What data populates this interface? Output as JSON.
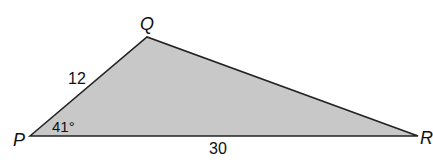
{
  "diagram": {
    "type": "triangle",
    "fill_color": "#c8c8c8",
    "stroke_color": "#222222",
    "vertices": [
      {
        "name": "P",
        "x": 30,
        "y": 136
      },
      {
        "name": "Q",
        "x": 147,
        "y": 37
      },
      {
        "name": "R",
        "x": 418,
        "y": 136
      }
    ],
    "labels": {
      "vertex_p": "P",
      "vertex_q": "Q",
      "vertex_r": "R",
      "side_pq": "12",
      "side_pr": "30",
      "angle_p": "41°"
    }
  }
}
